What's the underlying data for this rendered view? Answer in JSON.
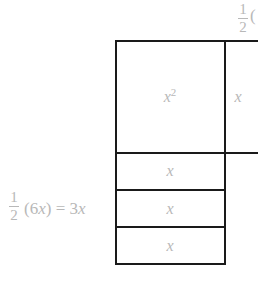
{
  "top_label": {
    "numerator": "1",
    "denominator": "2",
    "paren_open": "("
  },
  "square": {
    "label_base": "x",
    "label_exp": "2"
  },
  "right_rect": {
    "label": "x"
  },
  "strips": [
    {
      "label": "x"
    },
    {
      "label": "x"
    },
    {
      "label": "x"
    }
  ],
  "left_label": {
    "numerator": "1",
    "denominator": "2",
    "expr_a": "(6",
    "var": "x",
    "expr_b": ") = 3",
    "var2": "x"
  },
  "colors": {
    "line": "#1a1a1a",
    "text": "#b8b8b8",
    "background": "#ffffff"
  }
}
